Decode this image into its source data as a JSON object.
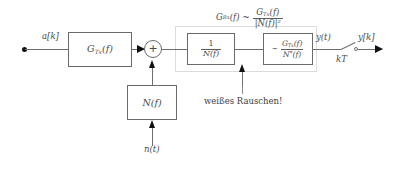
{
  "diagram": {
    "language": "de",
    "input": {
      "signal_label": "a[k]",
      "node_name": "source-dot"
    },
    "blocks": {
      "tx_filter": {
        "label": "G_Tx(f)",
        "label_main": "G",
        "label_sub": "Tx",
        "label_arg": "(f)"
      },
      "noise_shaping": {
        "label": "N(f)",
        "label_main": "N",
        "label_arg": "(f)"
      },
      "whitening": {
        "label": "1 / N(f)",
        "numerator": "1",
        "denominator": "N(f)"
      },
      "matched": {
        "label": "~ G_Tx(f) / N*(f)",
        "tilde": "~",
        "numerator_main": "G",
        "numerator_sub": "Tx",
        "numerator_arg": "(f)",
        "denominator_main": "N",
        "denominator_star": "*",
        "denominator_arg": "(f)"
      }
    },
    "adder": {
      "sign": "+",
      "name": "summing-junction"
    },
    "group_annotation": {
      "lhs_main": "G",
      "lhs_sub": "Rx",
      "lhs_arg": "(f)",
      "relation": "~",
      "numerator_main": "G",
      "numerator_sub": "Tx",
      "numerator_arg": "(f)",
      "denominator": "|N(f)|²",
      "full": "G_Rx(f) ~ G_Tx(f) / |N(f)|²"
    },
    "noise": {
      "input_label": "n(t)",
      "callout": "weißes Rauschen!"
    },
    "output": {
      "continuous_label": "y(t)",
      "sample_label": "kT",
      "discrete_label": "y[k]"
    },
    "colors": {
      "wire": "#6e6e6e",
      "block_border": "#6a6a6a",
      "group_border": "#dcdcdc",
      "text": "#4a4a4a",
      "arrow": "#111111",
      "background": "#ffffff"
    }
  }
}
